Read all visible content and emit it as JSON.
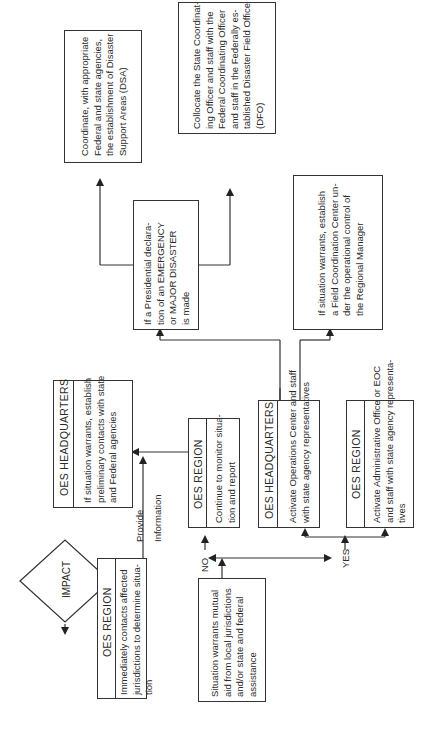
{
  "diagram": {
    "orientation": "rotated-90-ccw",
    "nodes": {
      "impact": {
        "label": "IMPACT"
      },
      "oes_region_1": {
        "header": "OES REGION",
        "lines": [
          "Immediately contacts affected",
          "jurisdictions to determine situa-",
          "tion"
        ]
      },
      "oes_hq_1": {
        "header": "OES HEADQUARTERS",
        "lines": [
          "If situation warrants, establish",
          "preliminary contacts with state",
          "and Federal agencies"
        ]
      },
      "situation": {
        "lines": [
          "Situation warrants mutual",
          "aid from local jurisdictions",
          "and/or state and federal",
          "assistance"
        ]
      },
      "oes_region_2": {
        "header": "OES REGION",
        "lines": [
          "Continue to monitor situa-",
          "tion and report"
        ]
      },
      "oes_hq_2": {
        "header": "OES HEADQUARTERS",
        "lines": [
          "Activate Operations Center and staff",
          "with state agency representatives"
        ]
      },
      "oes_region_3": {
        "header": "OES REGION",
        "lines": [
          "Activate Administrative Office or EOC",
          "and staff with state agency representa-",
          "tives"
        ]
      },
      "presidential": {
        "lines": [
          "If a Presidential declara-",
          "tion of an EMERGENCY",
          "or MAJOR DISASTER",
          "is made"
        ]
      },
      "field_coord": {
        "lines": [
          "If situation warrants, establish",
          "a Field Coordination Center un-",
          "der the operational control of",
          "the Regional Manager"
        ]
      },
      "dsa": {
        "lines": [
          "Coordinate, with appropriate",
          "Federal and state agencies,",
          "the establishment of Disaster",
          "Support Areas (DSA)"
        ]
      },
      "dfo": {
        "lines": [
          "Collocate the State Coordinat-",
          "ing Officer and staff with the",
          "Federal Coordinating Officer",
          "and staff in the Federally es-",
          "tablished Disaster Field Office",
          "(DFO)"
        ]
      }
    },
    "edge_labels": {
      "provide": "Provide",
      "information": "Information",
      "no": "NO",
      "yes": "YES"
    }
  }
}
